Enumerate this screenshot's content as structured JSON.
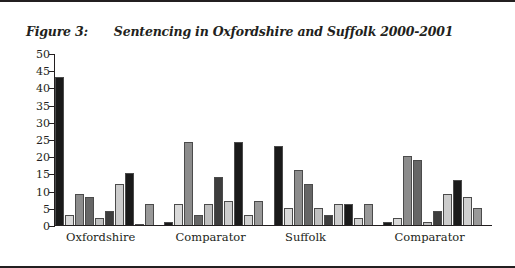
{
  "figure": {
    "label": "Figure 3:",
    "title": "Sentencing in Oxfordshire and Suffolk 2000-2001"
  },
  "chart_data": {
    "type": "bar",
    "title": "Sentencing in Oxfordshire and Suffolk 2000-2001",
    "xlabel": "",
    "ylabel": "",
    "ylim": [
      0,
      50
    ],
    "yticks": [
      0,
      5,
      10,
      15,
      20,
      25,
      30,
      35,
      40,
      45,
      50
    ],
    "grid": false,
    "legend": "none",
    "categories": [
      "Oxfordshire",
      "Comparator",
      "Suffolk",
      "Comparator"
    ],
    "series": [
      {
        "name": "Series 1",
        "color": "#1a1a1a",
        "values": [
          43,
          1,
          23,
          1
        ]
      },
      {
        "name": "Series 2",
        "color": "#d9d9d9",
        "values": [
          3,
          6,
          5,
          2
        ]
      },
      {
        "name": "Series 3",
        "color": "#8c8c8c",
        "values": [
          9,
          24,
          16,
          20
        ]
      },
      {
        "name": "Series 4",
        "color": "#666666",
        "values": [
          8,
          3,
          12,
          19
        ]
      },
      {
        "name": "Series 5",
        "color": "#bfbfbf",
        "values": [
          2,
          6,
          5,
          1
        ]
      },
      {
        "name": "Series 6",
        "color": "#3d3d3d",
        "values": [
          4,
          14,
          3,
          4
        ]
      },
      {
        "name": "Series 7",
        "color": "#cccccc",
        "values": [
          12,
          7,
          6,
          9
        ]
      },
      {
        "name": "Series 8",
        "color": "#1a1a1a",
        "values": [
          15,
          24,
          6,
          13
        ]
      },
      {
        "name": "Series 9",
        "color": "#d0d0d0",
        "values": [
          0,
          3,
          2,
          8
        ]
      },
      {
        "name": "Series 10",
        "color": "#999999",
        "values": [
          6,
          7,
          6,
          5
        ]
      }
    ]
  }
}
